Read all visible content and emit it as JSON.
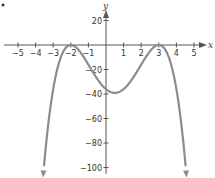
{
  "chart_data": {
    "type": "line",
    "title": "",
    "xlabel": "x",
    "ylabel": "y",
    "function": "f(x) = -(x + 2)^2 (x - 3)^2",
    "xlim": [
      -5,
      5
    ],
    "ylim": [
      -100,
      20
    ],
    "x_ticks": [
      -5,
      -4,
      -3,
      -2,
      -1,
      1,
      2,
      3,
      4,
      5
    ],
    "x_tick_labels": [
      "−5",
      "−4",
      "−3",
      "−2",
      "−1",
      "1",
      "2",
      "3",
      "4",
      "5"
    ],
    "y_ticks": [
      20,
      -20,
      -40,
      -60,
      -80,
      -100
    ],
    "y_tick_labels": [
      "20",
      "−20",
      "−40",
      "−60",
      "−80",
      "−100"
    ],
    "grid": false,
    "series": [
      {
        "name": "f(x)",
        "color": "#8c8c8c",
        "x": [
          -3.58,
          -3,
          -2.5,
          -2,
          -1.5,
          -1,
          -0.5,
          0,
          0.5,
          1,
          1.5,
          2,
          2.5,
          3,
          3.5,
          4,
          4.58
        ],
        "y": [
          -108,
          -36,
          -7.6,
          0,
          -5.1,
          -16,
          -27.6,
          -36,
          -39.1,
          -36,
          -27.6,
          -16,
          -5.1,
          0,
          -7.6,
          -36,
          -108
        ]
      }
    ],
    "key_points": [
      {
        "label": "double root",
        "x": -2,
        "y": 0
      },
      {
        "label": "double root",
        "x": 3,
        "y": 0
      },
      {
        "label": "y-intercept",
        "x": 0,
        "y": -36
      },
      {
        "label": "local minimum",
        "x": 0.5,
        "y": -39.06
      }
    ],
    "end_behavior": "both ends arrow downward"
  },
  "colors": {
    "axis": "#555555",
    "curve": "#8c8c8c",
    "text": "#333333"
  }
}
